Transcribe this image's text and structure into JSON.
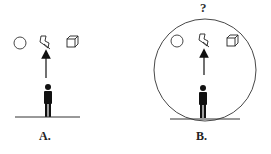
{
  "panels": [
    {
      "id": "A",
      "label": "A.",
      "objects": [
        "circle-icon",
        "lightning-icon",
        "cube-icon"
      ],
      "enclosed": false
    },
    {
      "id": "B",
      "label": "B.",
      "question_mark": "?",
      "objects": [
        "circle-icon",
        "lightning-icon",
        "cube-icon"
      ],
      "enclosed": true
    }
  ]
}
